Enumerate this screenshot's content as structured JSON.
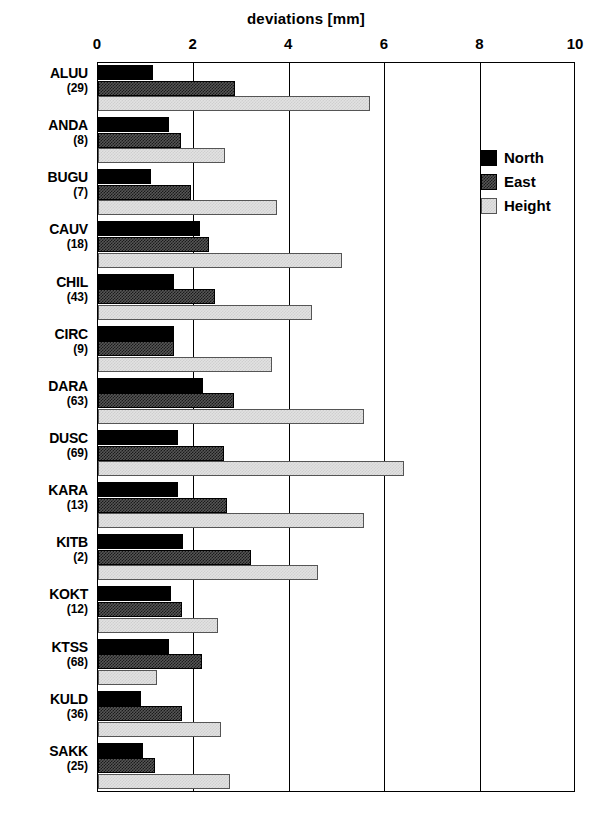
{
  "chart_data": {
    "type": "bar",
    "orientation": "horizontal",
    "title": "deviations  [mm]",
    "xlabel": "deviations  [mm]",
    "ylabel": "",
    "xlim": [
      0,
      10
    ],
    "xticks": [
      0,
      2,
      4,
      6,
      8,
      10
    ],
    "xtick_labels": [
      "0",
      "2",
      "4",
      "6",
      "8",
      "10"
    ],
    "grid": true,
    "legend_position": "right",
    "categories": [
      "ALUU",
      "ANDA",
      "BUGU",
      "CAUV",
      "CHIL",
      "CIRC",
      "DARA",
      "DUSC",
      "KARA",
      "KITB",
      "KOKT",
      "KTSS",
      "KULD",
      "SAKK"
    ],
    "category_counts": [
      "(29)",
      "(8)",
      "(7)",
      "(18)",
      "(43)",
      "(9)",
      "(63)",
      "(69)",
      "(13)",
      "(2)",
      "(12)",
      "(68)",
      "(36)",
      "(25)"
    ],
    "series": [
      {
        "name": "North",
        "color": "#000000",
        "values": [
          1.15,
          1.48,
          1.11,
          2.14,
          1.6,
          1.59,
          2.2,
          1.67,
          1.67,
          1.78,
          1.53,
          1.48,
          0.9,
          0.94
        ]
      },
      {
        "name": "East",
        "color": "#565656",
        "values": [
          2.87,
          1.74,
          1.94,
          2.33,
          2.45,
          1.6,
          2.84,
          2.63,
          2.7,
          3.2,
          1.76,
          2.17,
          1.76,
          1.19
        ]
      },
      {
        "name": "Height",
        "color": "#e2e2e2",
        "values": [
          5.69,
          2.66,
          3.75,
          5.1,
          4.47,
          3.63,
          5.57,
          6.41,
          5.56,
          4.6,
          2.51,
          1.23,
          2.58,
          2.77
        ]
      }
    ]
  },
  "legend": {
    "items": [
      {
        "label": "North",
        "swatch": "north-swatch"
      },
      {
        "label": "East",
        "swatch": "east-swatch"
      },
      {
        "label": "Height",
        "swatch": "height-swatch"
      }
    ]
  }
}
